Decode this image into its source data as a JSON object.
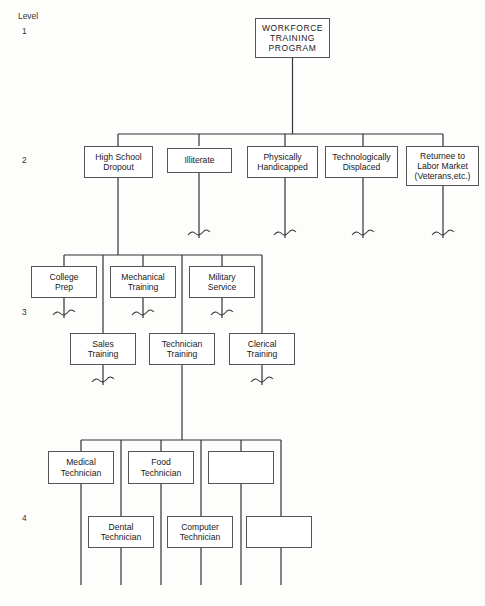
{
  "diagram": {
    "title": "WORKFORCE TRAINING PROGRAM",
    "type": "hierarchical-tree",
    "background_color": "#fdfdfc",
    "line_color": "#333333",
    "box_border_color": "#555555",
    "box_fill_color": "#ffffff",
    "level_label_prefix": "Level",
    "level_labels": [
      {
        "id": "level-1",
        "text": "Level",
        "number": "1"
      },
      {
        "id": "level-2",
        "number": "2"
      },
      {
        "id": "level-3",
        "number": "3"
      },
      {
        "id": "level-4",
        "number": "4"
      }
    ],
    "levels": [
      {
        "level": 1,
        "nodes": [
          {
            "id": "workforce-training-program",
            "lines": [
              "WORKFORCE",
              "TRAINING",
              "PROGRAM"
            ],
            "empty": false
          }
        ]
      },
      {
        "level": 2,
        "nodes": [
          {
            "id": "high-school-dropout",
            "lines": [
              "High School",
              "Dropout"
            ],
            "empty": false
          },
          {
            "id": "illiterate",
            "lines": [
              "Illiterate"
            ],
            "empty": false
          },
          {
            "id": "physically-handicapped",
            "lines": [
              "Physically",
              "Handicapped"
            ],
            "empty": false
          },
          {
            "id": "technologically-displaced",
            "lines": [
              "Technologically",
              "Displaced"
            ],
            "empty": false
          },
          {
            "id": "returnee-to-labor-market",
            "lines": [
              "Returnee to",
              "Labor Market",
              "(Veterans,etc.)"
            ],
            "empty": false
          }
        ]
      },
      {
        "level": 3,
        "nodes": [
          {
            "id": "college-prep",
            "lines": [
              "College",
              "Prep"
            ],
            "empty": false
          },
          {
            "id": "mechanical-training",
            "lines": [
              "Mechanical",
              "Training"
            ],
            "empty": false
          },
          {
            "id": "military-service",
            "lines": [
              "Military",
              "Service"
            ],
            "empty": false
          },
          {
            "id": "sales-training",
            "lines": [
              "Sales",
              "Training"
            ],
            "empty": false
          },
          {
            "id": "technician-training",
            "lines": [
              "Technician",
              "Training"
            ],
            "empty": false
          },
          {
            "id": "clerical-training",
            "lines": [
              "Clerical",
              "Training"
            ],
            "empty": false
          }
        ]
      },
      {
        "level": 4,
        "nodes": [
          {
            "id": "medical-technician",
            "lines": [
              "Medical",
              "Technician"
            ],
            "empty": false
          },
          {
            "id": "food-technician",
            "lines": [
              "Food",
              "Technician"
            ],
            "empty": false
          },
          {
            "id": "empty-box-top",
            "lines": [],
            "empty": true
          },
          {
            "id": "dental-technician",
            "lines": [
              "Dental",
              "Technician"
            ],
            "empty": false
          },
          {
            "id": "computer-technician",
            "lines": [
              "Computer",
              "Technician"
            ],
            "empty": false
          },
          {
            "id": "empty-box-bottom",
            "lines": [],
            "empty": true
          }
        ]
      }
    ]
  }
}
